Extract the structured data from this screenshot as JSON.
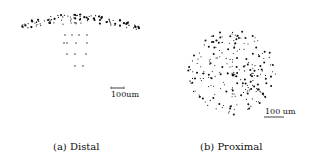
{
  "figure": {
    "panels": [
      {
        "id": "a",
        "caption": "(a) Distal",
        "scale_bar_label": "100um",
        "shape": "mushroom: dense arc cap with sparse vertical stem below"
      },
      {
        "id": "b",
        "caption": "(b) Proximal",
        "scale_bar_label": "100 um",
        "shape": "circular disk of scattered dots"
      }
    ],
    "colors": {
      "background": "#ffffff",
      "dots": "#111111",
      "text": "#111111"
    }
  }
}
